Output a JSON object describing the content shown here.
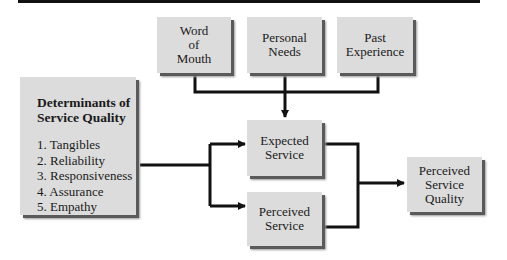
{
  "diagram": {
    "inputs": [
      {
        "lines": [
          "Word",
          "of",
          "Mouth"
        ]
      },
      {
        "lines": [
          "Personal",
          "Needs"
        ]
      },
      {
        "lines": [
          "Past",
          "Experience"
        ]
      }
    ],
    "determinants": {
      "title_lines": [
        "Determinants of",
        "Service Quality"
      ],
      "items": [
        "1. Tangibles",
        "2. Reliability",
        "3. Responsiveness",
        "4. Assurance",
        "5. Empathy"
      ]
    },
    "expected_service": {
      "lines": [
        "Expected",
        "Service"
      ]
    },
    "perceived_service": {
      "lines": [
        "Perceived",
        "Service"
      ]
    },
    "output": {
      "lines": [
        "Perceived",
        "Service",
        "Quality"
      ]
    },
    "colors": {
      "box_fill": "#dcdcdc",
      "box_shadow": "#5a5a5a",
      "connector": "#111111"
    }
  }
}
